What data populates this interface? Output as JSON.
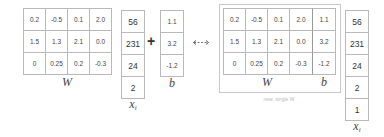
{
  "left": {
    "W": {
      "label": "W",
      "rows": [
        [
          "0.2",
          "-0.5",
          "0.1",
          "2.0"
        ],
        [
          "1.5",
          "1.3",
          "2.1",
          "0.0"
        ],
        [
          "0",
          "0.25",
          "0.2",
          "-0.3"
        ]
      ]
    },
    "x": {
      "label": "x",
      "subscript": "i",
      "values": [
        "56",
        "231",
        "24",
        "2"
      ]
    },
    "operator": "+",
    "b": {
      "label": "b",
      "values": [
        "1.1",
        "3.2",
        "-1.2"
      ]
    }
  },
  "equivalence_arrow": "double-arrow-icon",
  "right": {
    "W": {
      "label": "W",
      "rows": [
        [
          "0.2",
          "-0.5",
          "0.1",
          "2.0"
        ],
        [
          "1.5",
          "1.3",
          "2.1",
          "0.0"
        ],
        [
          "0",
          "0.25",
          "0.2",
          "-0.3"
        ]
      ]
    },
    "b": {
      "label": "b",
      "values": [
        "1.1",
        "3.2",
        "-1.2"
      ]
    },
    "caption": "new, single W",
    "x": {
      "label": "x",
      "subscript": "i",
      "values": [
        "56",
        "231",
        "24",
        "2",
        "1"
      ]
    }
  }
}
